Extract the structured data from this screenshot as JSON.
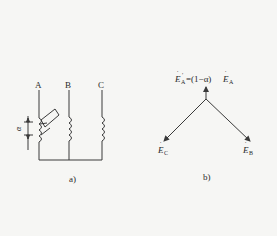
{
  "figure_a": {
    "caption": "a)",
    "phase_labels": [
      "A",
      "B",
      "C"
    ],
    "tap_label": "α"
  },
  "figure_b": {
    "caption": "b)",
    "top_label_lhs": "E",
    "top_label_lhs_sub": "A",
    "top_label_eq": "=(1−α)",
    "top_label_rhs": "E",
    "top_label_rhs_sub": "A",
    "left_label": "E",
    "left_label_sub": "C",
    "right_label": "E",
    "right_label_sub": "B"
  },
  "colors": {
    "line": "#3a3a3a",
    "background": "#f6f6f4"
  }
}
